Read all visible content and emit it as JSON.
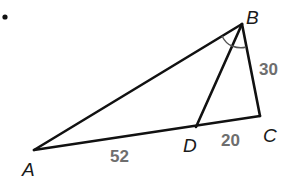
{
  "diagram": {
    "bullet": "•",
    "vertices": {
      "A": {
        "label": "A",
        "x": 34,
        "y": 150
      },
      "B": {
        "label": "B",
        "x": 242,
        "y": 24
      },
      "C": {
        "label": "C",
        "x": 260,
        "y": 116
      },
      "D": {
        "label": "D",
        "x": 196,
        "y": 127
      }
    },
    "segments": [
      "AB",
      "BC",
      "AC",
      "BD"
    ],
    "measures": {
      "BC": "30",
      "AD": "52",
      "DC": "20"
    },
    "angle_marks": [
      "ABD",
      "DBC"
    ],
    "colors": {
      "line": "#111111",
      "measure_text": "#6e6e6e",
      "vertex_text": "#1a1a1a"
    }
  }
}
